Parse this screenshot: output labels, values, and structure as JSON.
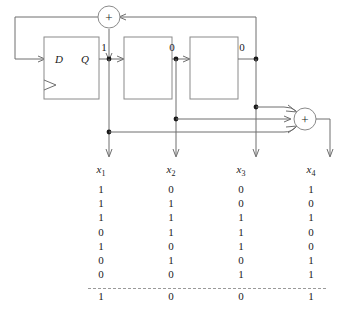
{
  "figure": {
    "type": "lfsr-shift-register-diagram"
  },
  "circuit": {
    "flipflop": {
      "input_label": "D",
      "output_label": "Q",
      "clock_marker": "clock-triangle"
    },
    "registers": [
      {
        "name": "stage-2",
        "label": ""
      },
      {
        "name": "stage-3",
        "label": ""
      }
    ],
    "adders": [
      {
        "name": "feedback-adder",
        "symbol": "+"
      },
      {
        "name": "output-adder",
        "symbol": "+"
      }
    ],
    "tap_values": [
      "1",
      "0",
      "0"
    ],
    "outputs": [
      "x1",
      "x2",
      "x3",
      "x4"
    ]
  },
  "labels": {
    "x1": "x",
    "x1_sub": "1",
    "x2": "x",
    "x2_sub": "2",
    "x3": "x",
    "x3_sub": "3",
    "x4": "x",
    "x4_sub": "4"
  },
  "chart_data": {
    "type": "table",
    "title": "",
    "columns": [
      "x1",
      "x2",
      "x3",
      "x4"
    ],
    "rows": [
      [
        "1",
        "0",
        "0",
        "1"
      ],
      [
        "1",
        "1",
        "0",
        "0"
      ],
      [
        "1",
        "1",
        "1",
        "1"
      ],
      [
        "0",
        "1",
        "1",
        "0"
      ],
      [
        "1",
        "0",
        "1",
        "0"
      ],
      [
        "0",
        "1",
        "0",
        "1"
      ],
      [
        "0",
        "0",
        "1",
        "1"
      ]
    ],
    "separator": "dashed",
    "summary_row": [
      "1",
      "0",
      "0",
      "1"
    ]
  }
}
